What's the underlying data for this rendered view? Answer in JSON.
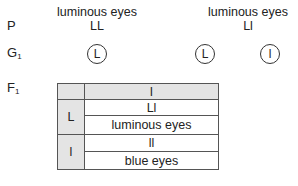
{
  "parents": {
    "row_label": "P",
    "left": {
      "phenotype": "luminous eyes",
      "genotype": "LL"
    },
    "right": {
      "phenotype": "luminous eyes",
      "genotype": "Ll"
    }
  },
  "gametes": {
    "row_label": "G",
    "row_label_sub": "1",
    "left": [
      "L"
    ],
    "right": [
      "L",
      "l"
    ]
  },
  "f1": {
    "row_label": "F",
    "row_label_sub": "1",
    "header": {
      "corner": "",
      "column": "l"
    },
    "rows": [
      {
        "gamete": "L",
        "genotype": "Ll",
        "phenotype": "luminous eyes"
      },
      {
        "gamete": "l",
        "genotype": "ll",
        "phenotype": "blue eyes"
      }
    ]
  },
  "colors": {
    "shade": "#e4e4e4",
    "border": "#555555",
    "text": "#222222"
  }
}
